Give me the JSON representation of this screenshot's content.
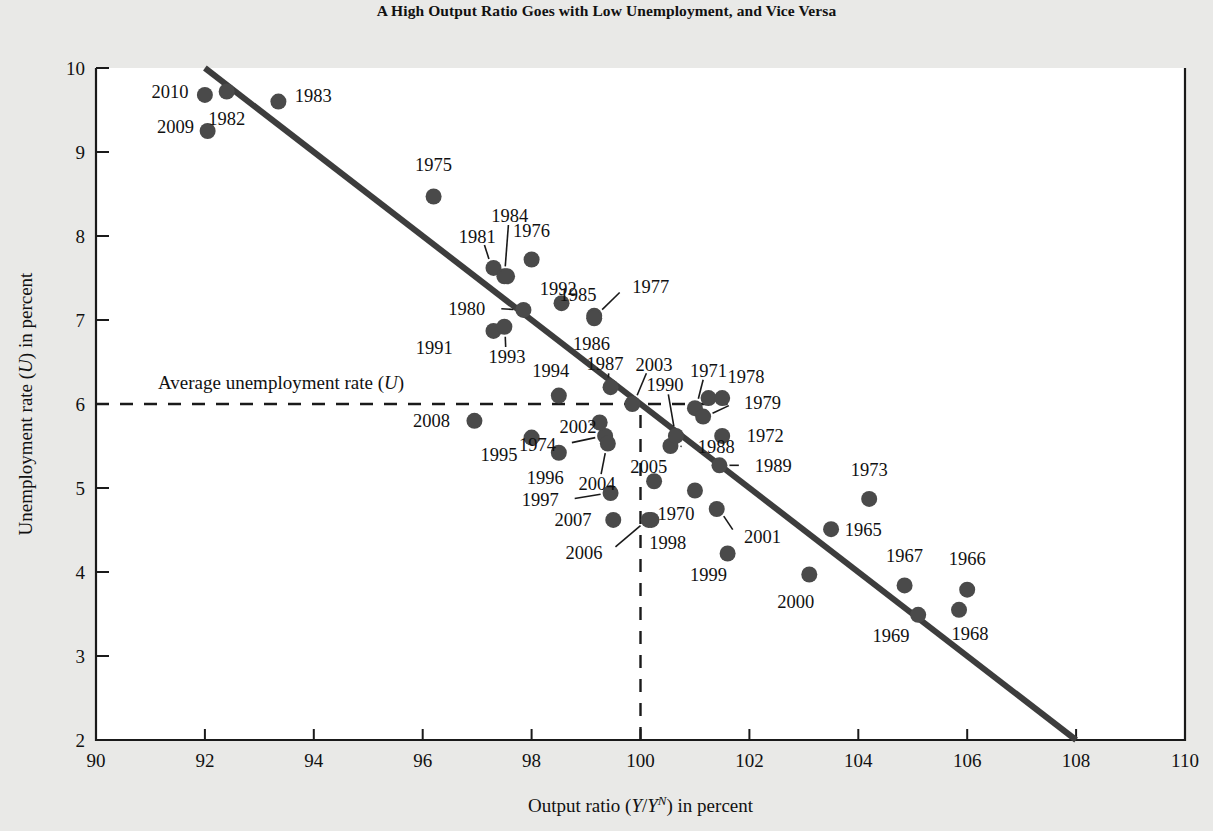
{
  "chart_data": {
    "type": "scatter",
    "title": "A High Output Ratio Goes with Low Unemployment, and Vice Versa",
    "xlabel": "Output ratio (Y/Yᴺ) in percent",
    "xlabel_parts": {
      "prefix": "Output ratio (",
      "ital1": "Y",
      "slash": "/",
      "ital2": "Y",
      "sup": "N",
      "suffix": ") in percent"
    },
    "ylabel": "Unemployment rate (U) in percent",
    "ylabel_parts": {
      "prefix": "Unemployment rate (",
      "ital": "U",
      "suffix": ") in percent"
    },
    "xlim": [
      90,
      110
    ],
    "ylim": [
      2,
      10
    ],
    "xticks": [
      90,
      92,
      94,
      96,
      98,
      100,
      102,
      104,
      106,
      108,
      110
    ],
    "yticks": [
      2,
      3,
      4,
      5,
      6,
      7,
      8,
      9,
      10
    ],
    "grid": false,
    "legend": null,
    "annotations": [
      {
        "name": "average-unemployment-line",
        "text": "Average unemployment rate (U)",
        "text_parts": {
          "prefix": "Average unemployment rate (",
          "ital": "U",
          "suffix": ")"
        },
        "style": "dashed-horizontal",
        "y": 6.0,
        "x_from": 90,
        "x_to": 101.6
      },
      {
        "name": "potential-output-line",
        "text": "",
        "style": "dashed-vertical",
        "x": 100,
        "y_from": 2.0,
        "y_to": 5.95
      }
    ],
    "trendline": {
      "name": "okun-regression-line",
      "x1": 92.0,
      "y1": 10.0,
      "x2": 108.0,
      "y2": 2.0,
      "color": "#3d3d3d"
    },
    "colors": {
      "marker": "#4a4a4a",
      "axis": "#1a1a1a",
      "plot_background": "#ffffff",
      "page_background": "#e9e9e7"
    },
    "points": [
      {
        "label": "1965",
        "x": 103.5,
        "y": 4.51,
        "lx": 103.75,
        "ly": 4.51,
        "anchor": "start",
        "leader": false
      },
      {
        "label": "1966",
        "x": 106.0,
        "y": 3.79,
        "lx": 106.0,
        "ly": 4.16,
        "anchor": "middle",
        "leader": false
      },
      {
        "label": "1967",
        "x": 104.85,
        "y": 3.84,
        "lx": 104.85,
        "ly": 4.2,
        "anchor": "middle",
        "leader": false
      },
      {
        "label": "1968",
        "x": 105.85,
        "y": 3.55,
        "lx": 106.05,
        "ly": 3.27,
        "anchor": "middle",
        "leader": false
      },
      {
        "label": "1969",
        "x": 105.1,
        "y": 3.49,
        "lx": 104.6,
        "ly": 3.24,
        "anchor": "middle",
        "leader": false
      },
      {
        "label": "1970",
        "x": 101.0,
        "y": 4.97,
        "lx": 100.65,
        "ly": 4.7,
        "anchor": "middle",
        "leader": false
      },
      {
        "label": "1971",
        "x": 101.0,
        "y": 5.95,
        "lx": 101.25,
        "ly": 6.4,
        "anchor": "middle",
        "leader": true
      },
      {
        "label": "1972",
        "x": 101.5,
        "y": 5.62,
        "lx": 101.95,
        "ly": 5.62,
        "anchor": "start",
        "leader": false
      },
      {
        "label": "1973",
        "x": 104.2,
        "y": 4.87,
        "lx": 104.2,
        "ly": 5.22,
        "anchor": "middle",
        "leader": false
      },
      {
        "label": "1974",
        "x": 99.35,
        "y": 5.62,
        "lx": 98.45,
        "ly": 5.52,
        "anchor": "end",
        "leader": true
      },
      {
        "label": "1975",
        "x": 96.2,
        "y": 8.47,
        "lx": 96.2,
        "ly": 8.85,
        "anchor": "middle",
        "leader": false
      },
      {
        "label": "1976",
        "x": 98.0,
        "y": 7.72,
        "lx": 98.0,
        "ly": 8.07,
        "anchor": "middle",
        "leader": false
      },
      {
        "label": "1977",
        "x": 99.15,
        "y": 7.05,
        "lx": 99.85,
        "ly": 7.4,
        "anchor": "start",
        "leader": true
      },
      {
        "label": "1978",
        "x": 101.25,
        "y": 6.07,
        "lx": 101.6,
        "ly": 6.33,
        "anchor": "start",
        "leader": false
      },
      {
        "label": "1979",
        "x": 101.15,
        "y": 5.85,
        "lx": 101.9,
        "ly": 6.02,
        "anchor": "start",
        "leader": true
      },
      {
        "label": "1980",
        "x": 97.85,
        "y": 7.12,
        "lx": 97.15,
        "ly": 7.14,
        "anchor": "end",
        "leader": true
      },
      {
        "label": "1981",
        "x": 97.3,
        "y": 7.62,
        "lx": 97.0,
        "ly": 8.0,
        "anchor": "middle",
        "leader": true
      },
      {
        "label": "1982",
        "x": 92.4,
        "y": 9.72,
        "lx": 92.4,
        "ly": 9.4,
        "anchor": "middle",
        "leader": false
      },
      {
        "label": "1983",
        "x": 93.35,
        "y": 9.6,
        "lx": 93.65,
        "ly": 9.67,
        "anchor": "start",
        "leader": false
      },
      {
        "label": "1984",
        "x": 97.5,
        "y": 7.52,
        "lx": 97.6,
        "ly": 8.25,
        "anchor": "middle",
        "leader": true
      },
      {
        "label": "1985",
        "x": 98.55,
        "y": 7.2,
        "lx": 98.85,
        "ly": 7.3,
        "anchor": "middle",
        "leader": false
      },
      {
        "label": "1986",
        "x": 99.15,
        "y": 7.02,
        "lx": 99.1,
        "ly": 6.72,
        "anchor": "middle",
        "leader": false
      },
      {
        "label": "1987",
        "x": 99.45,
        "y": 6.2,
        "lx": 99.35,
        "ly": 6.48,
        "anchor": "middle",
        "leader": true
      },
      {
        "label": "1988",
        "x": 100.55,
        "y": 5.5,
        "lx": 101.05,
        "ly": 5.49,
        "anchor": "start",
        "leader": true
      },
      {
        "label": "1989",
        "x": 101.45,
        "y": 5.27,
        "lx": 102.1,
        "ly": 5.27,
        "anchor": "start",
        "leader": true
      },
      {
        "label": "1990",
        "x": 100.65,
        "y": 5.62,
        "lx": 100.45,
        "ly": 6.23,
        "anchor": "middle",
        "leader": true
      },
      {
        "label": "1991",
        "x": 97.3,
        "y": 6.87,
        "lx": 96.55,
        "ly": 6.67,
        "anchor": "end",
        "leader": false
      },
      {
        "label": "1992",
        "x": 97.55,
        "y": 7.52,
        "lx": 98.15,
        "ly": 7.37,
        "anchor": "start",
        "leader": false
      },
      {
        "label": "1993",
        "x": 97.5,
        "y": 6.92,
        "lx": 97.55,
        "ly": 6.56,
        "anchor": "middle",
        "leader": true
      },
      {
        "label": "1994",
        "x": 98.5,
        "y": 6.1,
        "lx": 98.35,
        "ly": 6.4,
        "anchor": "middle",
        "leader": false
      },
      {
        "label": "1995",
        "x": 98.0,
        "y": 5.6,
        "lx": 97.4,
        "ly": 5.4,
        "anchor": "middle",
        "leader": false
      },
      {
        "label": "1996",
        "x": 98.5,
        "y": 5.42,
        "lx": 98.25,
        "ly": 5.12,
        "anchor": "middle",
        "leader": false
      },
      {
        "label": "1997",
        "x": 99.45,
        "y": 4.94,
        "lx": 98.5,
        "ly": 4.86,
        "anchor": "end",
        "leader": true
      },
      {
        "label": "1998",
        "x": 100.2,
        "y": 4.62,
        "lx": 100.5,
        "ly": 4.35,
        "anchor": "middle",
        "leader": false
      },
      {
        "label": "1999",
        "x": 101.6,
        "y": 4.22,
        "lx": 101.25,
        "ly": 3.97,
        "anchor": "middle",
        "leader": false
      },
      {
        "label": "2000",
        "x": 103.1,
        "y": 3.97,
        "lx": 102.85,
        "ly": 3.65,
        "anchor": "middle",
        "leader": false
      },
      {
        "label": "2001",
        "x": 101.4,
        "y": 4.75,
        "lx": 101.9,
        "ly": 4.42,
        "anchor": "start",
        "leader": true
      },
      {
        "label": "2002",
        "x": 99.25,
        "y": 5.78,
        "lx": 98.85,
        "ly": 5.73,
        "anchor": "middle",
        "leader": true
      },
      {
        "label": "2003",
        "x": 99.85,
        "y": 6.0,
        "lx": 100.25,
        "ly": 6.47,
        "anchor": "middle",
        "leader": true
      },
      {
        "label": "2004",
        "x": 99.4,
        "y": 5.53,
        "lx": 99.2,
        "ly": 5.05,
        "anchor": "middle",
        "leader": true
      },
      {
        "label": "2005",
        "x": 100.25,
        "y": 5.08,
        "lx": 100.15,
        "ly": 5.26,
        "anchor": "middle",
        "leader": false
      },
      {
        "label": "2006",
        "x": 100.15,
        "y": 4.62,
        "lx": 99.3,
        "ly": 4.23,
        "anchor": "end",
        "leader": true
      },
      {
        "label": "2007",
        "x": 99.5,
        "y": 4.62,
        "lx": 99.1,
        "ly": 4.62,
        "anchor": "end",
        "leader": false
      },
      {
        "label": "2008",
        "x": 96.95,
        "y": 5.8,
        "lx": 96.5,
        "ly": 5.8,
        "anchor": "end",
        "leader": false
      },
      {
        "label": "2009",
        "x": 92.05,
        "y": 9.25,
        "lx": 91.8,
        "ly": 9.3,
        "anchor": "end",
        "leader": false
      },
      {
        "label": "2010",
        "x": 92.0,
        "y": 9.68,
        "lx": 91.7,
        "ly": 9.72,
        "anchor": "end",
        "leader": false
      },
      {
        "label": "2101-hidden",
        "x": 101.5,
        "y": 6.07,
        "lx": 101.5,
        "ly": 6.07,
        "anchor": "middle",
        "leader": false,
        "hide_label": true
      }
    ]
  }
}
